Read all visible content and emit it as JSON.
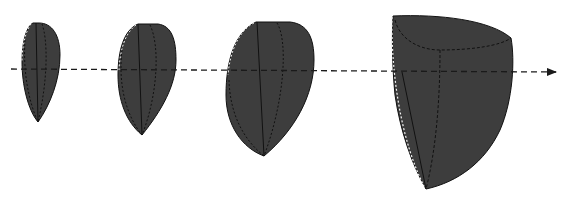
{
  "diagram": {
    "colors": {
      "background": "#ffffff",
      "fill": "#3d3d3d",
      "stroke": "#111111",
      "axis": "#1a1a1a",
      "highlight_edge": "#f2f2f2"
    },
    "axis": {
      "label": "",
      "x_start": 11,
      "x_end": 556,
      "y": 69,
      "style": "dashed-arrow"
    },
    "shapes": [
      {
        "id": "shape-1",
        "label": "",
        "size_rank": 1
      },
      {
        "id": "shape-2",
        "label": "",
        "size_rank": 2
      },
      {
        "id": "shape-3",
        "label": "",
        "size_rank": 3
      },
      {
        "id": "shape-4",
        "label": "",
        "size_rank": 4
      }
    ]
  }
}
